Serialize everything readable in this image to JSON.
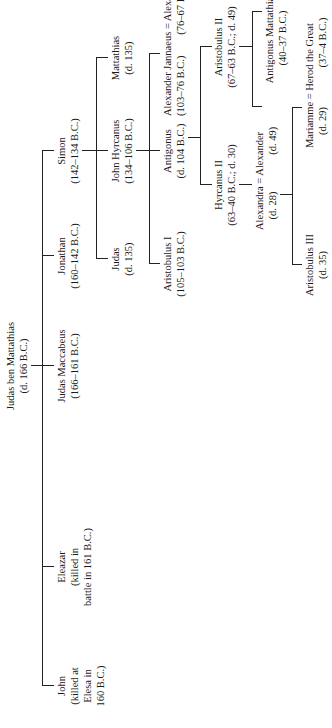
{
  "orientation": "rotated 90deg counterclockwise",
  "nodes": {
    "judas_ben_mattathias": {
      "name": "Judas ben Mattathias",
      "detail": "(d. 166 B.C.)"
    },
    "john": {
      "name": "John",
      "detail1": "(killed at",
      "detail2": "Elesa in",
      "detail3": "160 B.C.)"
    },
    "eleazar": {
      "name": "Eleazar",
      "detail1": "(killed in",
      "detail2": "battle in 161 B.C.)"
    },
    "judas_maccabeus": {
      "name": "Judas Maccabeus",
      "detail": "(166–161 B.C.)"
    },
    "jonathan": {
      "name": "Jonathan",
      "detail": "(160–142 B.C.)"
    },
    "simon": {
      "name": "Simon",
      "detail": "(142–134 B.C.)"
    },
    "judas": {
      "name": "Judas",
      "detail": "(d. 135)"
    },
    "john_hyrcanus": {
      "name": "John Hyrcanus",
      "detail": "(134–106 B.C.)"
    },
    "mattathias": {
      "name": "Mattathias",
      "detail": "(d. 135)"
    },
    "aristobulus_i": {
      "name": "Aristobulus I",
      "detail": "(105–103 B.C.)"
    },
    "antigonus": {
      "name": "Antigonus",
      "detail": "(d. 104 B.C.)"
    },
    "alexander_jannaeus_alexandra": {
      "name": "Alexander Jannaeus = Alexandra",
      "detail1": "(103–76 B.C.)",
      "detail2": "(76–67 B.C.)"
    },
    "hyrcanus_ii": {
      "name": "Hyrcanus II",
      "detail": "(63–40 B.C.; d. 30)"
    },
    "aristobulus_ii": {
      "name": "Aristobulus II",
      "detail": "(67–63 B.C.; d. 49)"
    },
    "alexandra_alexander": {
      "name": "Alexandra = Alexander",
      "detail1": "(d. 28)",
      "detail2": "(d. 49)"
    },
    "antigonus_mattathias": {
      "name": "Antigonus Mattathias",
      "detail": "(40–37 B.C.)"
    },
    "aristobulus_iii": {
      "name": "Aristobulus III",
      "detail": "(d. 35)"
    },
    "mariamme_herod": {
      "name": "Mariamme = Herod the Great",
      "detail1": "(d. 29)",
      "detail2": "(37–4 B.C.)"
    }
  }
}
